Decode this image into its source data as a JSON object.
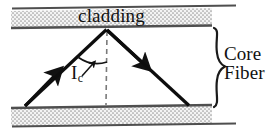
{
  "figure": {
    "type": "optical-fiber-ray-diagram",
    "width": 274,
    "height": 136
  },
  "labels": {
    "cladding": "cladding",
    "core_line1": "Core",
    "core_line2": "Fiber",
    "angle_symbol": "I",
    "angle_subscript": "c"
  },
  "colors": {
    "ink": "#111111",
    "line": "#5a5a5a",
    "hatch_fill": "#f2f2f2",
    "hatch_dot": "#9a9a9a",
    "background": "#ffffff"
  },
  "geometry": {
    "cladding_top_band": {
      "y_top": 10,
      "y_bottom": 27
    },
    "cladding_bottom_band": {
      "y_top": 106,
      "y_bottom": 124
    },
    "boundary_lines_y": [
      8,
      27,
      105,
      126
    ],
    "core_region": {
      "y_top": 27,
      "y_bottom": 105
    },
    "ray_apex": {
      "x": 107,
      "y": 29
    },
    "ray_start": {
      "x": 25,
      "y": 106
    },
    "ray_end": {
      "x": 189,
      "y": 105
    },
    "normal_dashed_line": {
      "x": 107,
      "y_top": 30,
      "y_bottom": 105
    },
    "critical_angle_arc_radius": 26,
    "brace": {
      "x": 212,
      "y_top": 28,
      "y_bottom": 108
    }
  },
  "elements": {
    "incident_ray": "incident-ray-up",
    "reflected_ray": "reflected-ray-down",
    "normal": "normal-dashed-line",
    "angle_arc": "critical-angle-arc",
    "leader": "angle-leader-arrow",
    "brace": "core-fiber-brace"
  }
}
